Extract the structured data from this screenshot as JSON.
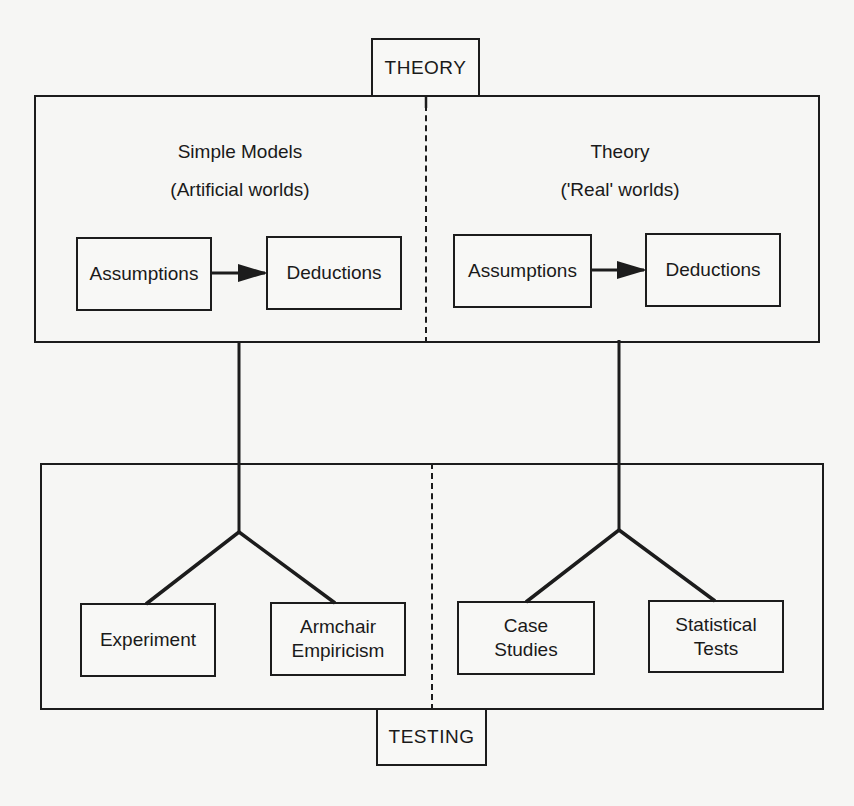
{
  "diagram": {
    "top_label": "THEORY",
    "bottom_label": "TESTING",
    "theory": {
      "left": {
        "title": "Simple Models",
        "subtitle": "(Artificial worlds)",
        "assumptions": "Assumptions",
        "deductions": "Deductions"
      },
      "right": {
        "title": "Theory",
        "subtitle": "('Real' worlds)",
        "assumptions": "Assumptions",
        "deductions": "Deductions"
      }
    },
    "testing": {
      "left": {
        "experiment": "Experiment",
        "armchair_line1": "Armchair",
        "armchair_line2": "Empiricism"
      },
      "right": {
        "case_line1": "Case",
        "case_line2": "Studies",
        "stat_line1": "Statistical",
        "stat_line2": "Tests"
      }
    },
    "colors": {
      "line": "#1c1c1c",
      "background": "#f6f6f4"
    }
  }
}
